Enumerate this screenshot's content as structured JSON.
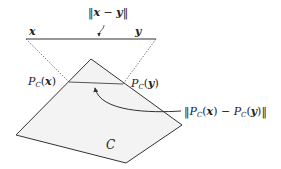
{
  "diagram": {
    "type": "projection-nonexpansive",
    "set_label": "C",
    "point_x_label": "x",
    "point_y_label": "y",
    "distance_xy": {
      "open": "‖",
      "a": "x",
      "minus": " − ",
      "b": "y",
      "close": "‖"
    },
    "proj_x": {
      "P": "P",
      "sub": "C",
      "open": "(",
      "arg": "x",
      "close": ")"
    },
    "proj_y": {
      "P": "P",
      "sub": "C",
      "open": "(",
      "arg": "y",
      "close": ")"
    },
    "distance_proj": {
      "open": "‖",
      "P1": "P",
      "sub1": "C",
      "arg1": "x",
      "minus": " − ",
      "P2": "P",
      "sub2": "C",
      "arg2": "y",
      "close": "‖"
    },
    "colors": {
      "stroke": "#333333",
      "dotted": "#555555",
      "fill": "#f3f3f3",
      "background": "#ffffff"
    }
  }
}
